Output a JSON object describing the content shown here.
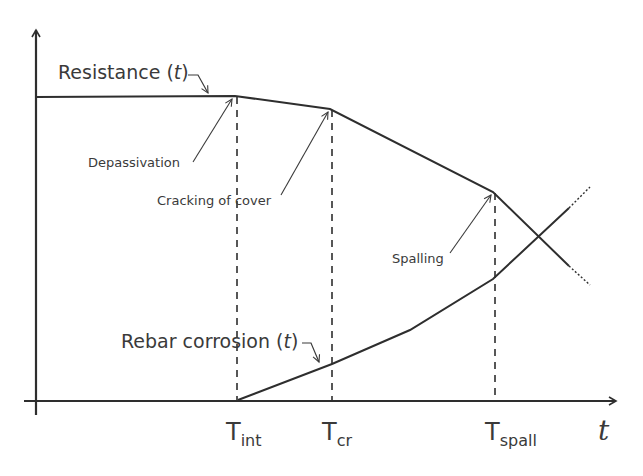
{
  "diagram": {
    "curves": {
      "resistance": {
        "label_prefix": "Resistance (",
        "label_var": "t",
        "label_suffix": ")"
      },
      "rebar": {
        "label_prefix": "Rebar corrosion (",
        "label_var": "t",
        "label_suffix": ")"
      }
    },
    "annotations": {
      "depassivation": "Depassivation",
      "cracking": "Cracking of cover",
      "spalling": "Spalling"
    },
    "x_ticks": [
      {
        "base": "T",
        "sub": "int"
      },
      {
        "base": "T",
        "sub": "cr"
      },
      {
        "base": "T",
        "sub": "spall"
      }
    ],
    "x_axis_label": "t",
    "colors": {
      "line": "#2e2e2e",
      "text": "#3a3a3a"
    }
  }
}
